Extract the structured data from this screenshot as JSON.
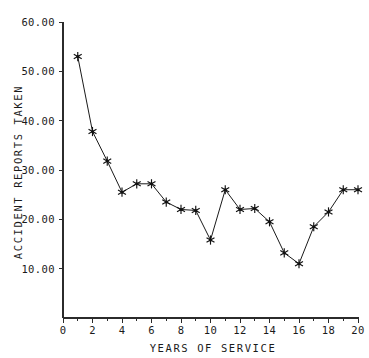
{
  "chart_data": {
    "type": "line",
    "title": "",
    "xlabel": "YEARS OF SERVICE",
    "ylabel": "ACCIDENT REPORTS TAKEN",
    "xlim": [
      0,
      20
    ],
    "ylim": [
      0,
      60
    ],
    "grid": false,
    "legend": null,
    "marker": "asterisk",
    "x": [
      1,
      2,
      3,
      4,
      5,
      6,
      7,
      8,
      9,
      10,
      11,
      12,
      13,
      14,
      15,
      16,
      17,
      18,
      19,
      20
    ],
    "values": [
      53.0,
      37.8,
      31.8,
      25.5,
      27.2,
      27.2,
      23.5,
      22.0,
      21.8,
      15.8,
      26.0,
      22.0,
      22.2,
      19.5,
      13.2,
      11.0,
      18.5,
      21.5,
      26.0,
      26.0
    ],
    "x_ticks": [
      "0",
      "2",
      "4",
      "6",
      "8",
      "10",
      "12",
      "14",
      "16",
      "18",
      "20"
    ],
    "x_tick_values": [
      0,
      2,
      4,
      6,
      8,
      10,
      12,
      14,
      16,
      18,
      20
    ],
    "x_minor_tick_values": [
      1,
      3,
      5,
      7,
      9,
      11,
      13,
      15,
      17,
      19
    ],
    "y_ticks": [
      "10.00",
      "20.00",
      "30.00",
      "40.00",
      "50.00",
      "60.00"
    ],
    "y_tick_values": [
      10,
      20,
      30,
      40,
      50,
      60
    ],
    "series_name": "Accident reports taken",
    "colors": {
      "line": "#1a1a1a",
      "marker": "#111111",
      "axis": "#2b2b2b",
      "background": "#ffffff"
    }
  },
  "caption": {
    "cut_off_text": ""
  }
}
